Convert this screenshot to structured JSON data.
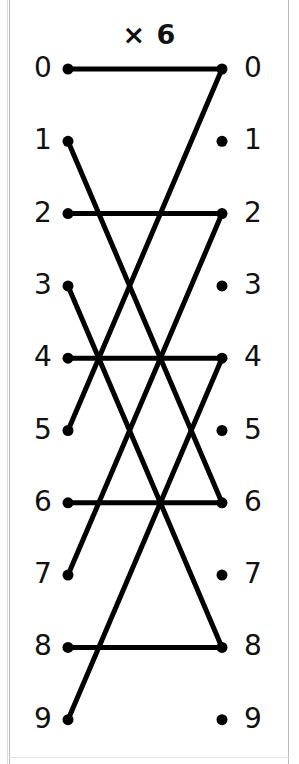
{
  "title": "× 6",
  "diagram": {
    "type": "bipartite-multiplication-graph",
    "modulus": 10,
    "multiplier": 6,
    "left_labels": [
      "0",
      "1",
      "2",
      "3",
      "4",
      "5",
      "6",
      "7",
      "8",
      "9"
    ],
    "right_labels": [
      "0",
      "1",
      "2",
      "3",
      "4",
      "5",
      "6",
      "7",
      "8",
      "9"
    ],
    "left_column_x": 68,
    "right_column_x": 222,
    "first_row_y": 69,
    "row_spacing": 72.3,
    "dot_radius": 5.5,
    "line_width": 5,
    "line_color": "#000000",
    "dot_color": "#000000",
    "label_color": "#111111",
    "background": "#ffffff",
    "frame_color": "#b9bcc0",
    "edges": [
      {
        "from": 0,
        "to": 0
      },
      {
        "from": 1,
        "to": 6
      },
      {
        "from": 2,
        "to": 2
      },
      {
        "from": 3,
        "to": 8
      },
      {
        "from": 4,
        "to": 4
      },
      {
        "from": 5,
        "to": 0
      },
      {
        "from": 6,
        "to": 6
      },
      {
        "from": 7,
        "to": 2
      },
      {
        "from": 8,
        "to": 8
      },
      {
        "from": 9,
        "to": 4
      }
    ]
  }
}
